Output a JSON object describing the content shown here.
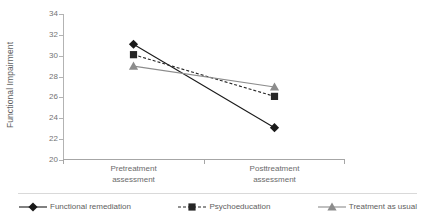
{
  "chart_data": {
    "type": "line",
    "title": "",
    "subtitle": "",
    "xlabel": "",
    "ylabel": "Functional Impairment",
    "categories": [
      "Pretreatment assessment",
      "Posttreatment assessment"
    ],
    "category_lines": [
      [
        "Pretreatment",
        "assessment"
      ],
      [
        "Posttreatment",
        "assessment"
      ]
    ],
    "ylim": [
      20,
      34
    ],
    "yticks": [
      34,
      32,
      30,
      28,
      26,
      24,
      22,
      20
    ],
    "ytick_labels": [
      "34",
      "32",
      "30",
      "28",
      "26",
      "24",
      "22",
      "20"
    ],
    "grid": false,
    "legend_position": "bottom",
    "series": [
      {
        "name": "Functional remediation",
        "values": [
          31.1,
          23.1
        ],
        "marker": "diamond",
        "line_style": "solid",
        "color": "#1a1a1a"
      },
      {
        "name": "Psychoeducation",
        "values": [
          30.1,
          26.1
        ],
        "marker": "square",
        "line_style": "dashed",
        "color": "#262626"
      },
      {
        "name": "Treatment as usual",
        "values": [
          29.0,
          27.0
        ],
        "marker": "triangle",
        "line_style": "solid",
        "color": "#8c8c8c"
      }
    ]
  }
}
